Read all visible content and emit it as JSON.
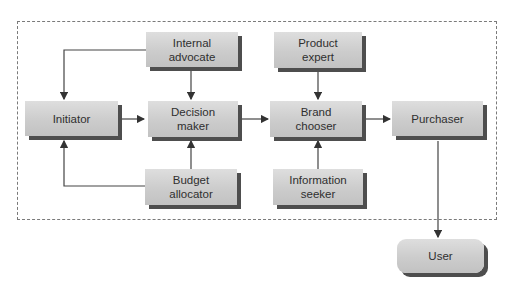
{
  "diagram": {
    "boundary": "buying-center",
    "nodes": {
      "internal_advocate": "Internal\nadvocate",
      "product_expert": "Product\nexpert",
      "initiator": "Initiator",
      "decision_maker": "Decision\nmaker",
      "brand_chooser": "Brand\nchooser",
      "purchaser": "Purchaser",
      "budget_allocator": "Budget\nallocator",
      "information_seeker": "Information\nseeker",
      "user": "User"
    },
    "edges": [
      {
        "from": "internal_advocate",
        "to": "initiator"
      },
      {
        "from": "internal_advocate",
        "to": "decision_maker"
      },
      {
        "from": "initiator",
        "to": "decision_maker"
      },
      {
        "from": "budget_allocator",
        "to": "initiator"
      },
      {
        "from": "budget_allocator",
        "to": "decision_maker"
      },
      {
        "from": "decision_maker",
        "to": "brand_chooser"
      },
      {
        "from": "product_expert",
        "to": "brand_chooser"
      },
      {
        "from": "information_seeker",
        "to": "brand_chooser"
      },
      {
        "from": "brand_chooser",
        "to": "purchaser"
      },
      {
        "from": "purchaser",
        "to": "user"
      }
    ],
    "colors": {
      "box": "#cccccc",
      "shadow": "#4e4e4e",
      "line": "#444444",
      "text": "#2f2f2f"
    }
  }
}
